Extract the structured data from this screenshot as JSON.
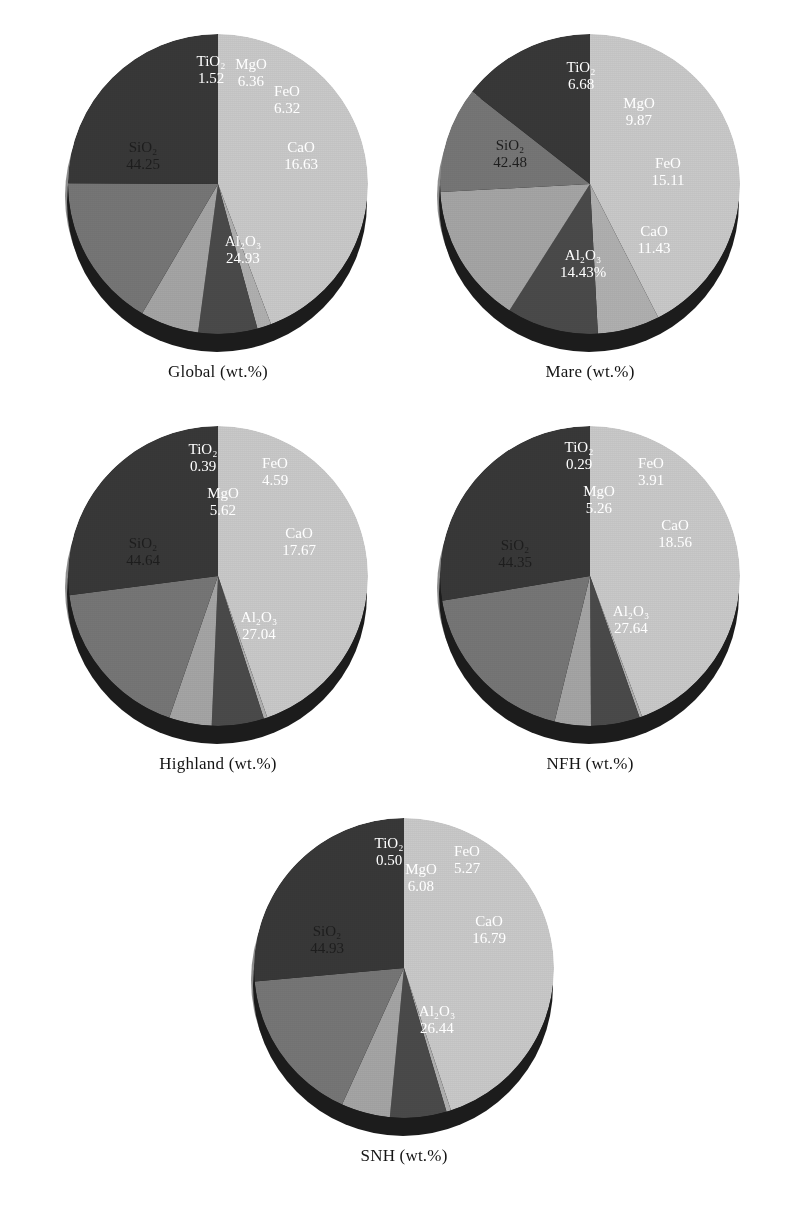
{
  "figure": {
    "background": "#ffffff",
    "label_suffix": "(wt.%)"
  },
  "palette": {
    "SiO2": "#c9c9c9",
    "TiO2": "#b0b0b0",
    "MgO": "#4a4a4a",
    "FeO": "#a5a5a5",
    "CaO": "#767676",
    "Al2O3": "#383838",
    "side_dark": "#1c1c1c",
    "side_light": "#8d8d8d",
    "text_dark": "#1d1d1d",
    "text_light": "#ffffff"
  },
  "chart_data": [
    {
      "type": "pie",
      "title": "Global (wt.%)",
      "region": "Global",
      "units": "wt.%",
      "categories": [
        "SiO2",
        "TiO2",
        "MgO",
        "FeO",
        "CaO",
        "Al2O3"
      ],
      "labels": [
        "SiO₂",
        "TiO₂",
        "MgO",
        "FeO",
        "CaO",
        "Al₂O₃"
      ],
      "values": [
        44.25,
        1.52,
        6.36,
        6.32,
        16.63,
        24.93
      ],
      "value_text": [
        "44.25",
        "1.52",
        "6.36",
        "6.32",
        "16.63",
        "24.93"
      ],
      "label_color": [
        "dark",
        "light",
        "light",
        "light",
        "light",
        "light"
      ]
    },
    {
      "type": "pie",
      "title": "Mare (wt.%)",
      "region": "Mare",
      "units": "wt.%",
      "categories": [
        "SiO2",
        "TiO2",
        "MgO",
        "FeO",
        "CaO",
        "Al2O3"
      ],
      "labels": [
        "SiO₂",
        "TiO₂",
        "MgO",
        "FeO",
        "CaO",
        "Al₂O₃"
      ],
      "values": [
        42.48,
        6.68,
        9.87,
        15.11,
        11.43,
        14.43
      ],
      "value_text": [
        "42.48",
        "6.68",
        "9.87",
        "15.11",
        "11.43",
        "14.43%"
      ],
      "label_color": [
        "dark",
        "light",
        "light",
        "light",
        "light",
        "light"
      ]
    },
    {
      "type": "pie",
      "title": "Highland (wt.%)",
      "region": "Highland",
      "units": "wt.%",
      "categories": [
        "SiO2",
        "TiO2",
        "MgO",
        "FeO",
        "CaO",
        "Al2O3"
      ],
      "labels": [
        "SiO₂",
        "TiO₂",
        "MgO",
        "FeO",
        "CaO",
        "Al₂O₃"
      ],
      "values": [
        44.64,
        0.39,
        5.62,
        4.59,
        17.67,
        27.04
      ],
      "value_text": [
        "44.64",
        "0.39",
        "5.62",
        "4.59",
        "17.67",
        "27.04"
      ],
      "label_color": [
        "dark",
        "light",
        "light",
        "light",
        "light",
        "light"
      ]
    },
    {
      "type": "pie",
      "title": "NFH (wt.%)",
      "region": "NFH",
      "units": "wt.%",
      "categories": [
        "SiO2",
        "TiO2",
        "MgO",
        "FeO",
        "CaO",
        "Al2O3"
      ],
      "labels": [
        "SiO₂",
        "TiO₂",
        "MgO",
        "FeO",
        "CaO",
        "Al₂O₃"
      ],
      "values": [
        44.35,
        0.29,
        5.26,
        3.91,
        18.56,
        27.64
      ],
      "value_text": [
        "44.35",
        "0.29",
        "5.26",
        "3.91",
        "18.56",
        "27.64"
      ],
      "label_color": [
        "dark",
        "light",
        "light",
        "light",
        "light",
        "light"
      ]
    },
    {
      "type": "pie",
      "title": "SNH (wt.%)",
      "region": "SNH",
      "units": "wt.%",
      "categories": [
        "SiO2",
        "TiO2",
        "MgO",
        "FeO",
        "CaO",
        "Al2O3"
      ],
      "labels": [
        "SiO₂",
        "TiO₂",
        "MgO",
        "FeO",
        "CaO",
        "Al₂O₃"
      ],
      "values": [
        44.93,
        0.5,
        6.08,
        5.27,
        16.79,
        26.44
      ],
      "value_text": [
        "44.93",
        "0.50",
        "6.08",
        "5.27",
        "16.79",
        "26.44"
      ],
      "label_color": [
        "dark",
        "light",
        "light",
        "light",
        "light",
        "light"
      ]
    }
  ],
  "layout": {
    "positions": [
      {
        "left": 38,
        "top": 28
      },
      {
        "left": 410,
        "top": 28
      },
      {
        "left": 38,
        "top": 420
      },
      {
        "left": 410,
        "top": 420
      },
      {
        "left": 224,
        "top": 812
      }
    ],
    "label_offsets": [
      [
        {
          "x": 80,
          "y": 128,
          "c": "dark"
        },
        {
          "x": 148,
          "y": 42,
          "c": "light"
        },
        {
          "x": 188,
          "y": 45,
          "c": "light"
        },
        {
          "x": 224,
          "y": 72,
          "c": "light"
        },
        {
          "x": 238,
          "y": 128,
          "c": "light"
        },
        {
          "x": 180,
          "y": 222,
          "c": "light"
        }
      ],
      [
        {
          "x": 75,
          "y": 126,
          "c": "dark"
        },
        {
          "x": 146,
          "y": 48,
          "c": "light"
        },
        {
          "x": 204,
          "y": 84,
          "c": "light"
        },
        {
          "x": 233,
          "y": 144,
          "c": "light"
        },
        {
          "x": 219,
          "y": 212,
          "c": "light"
        },
        {
          "x": 148,
          "y": 236,
          "c": "light"
        }
      ],
      [
        {
          "x": 80,
          "y": 132,
          "c": "dark"
        },
        {
          "x": 140,
          "y": 38,
          "c": "light"
        },
        {
          "x": 160,
          "y": 82,
          "c": "light"
        },
        {
          "x": 212,
          "y": 52,
          "c": "light"
        },
        {
          "x": 236,
          "y": 122,
          "c": "light"
        },
        {
          "x": 196,
          "y": 206,
          "c": "light"
        }
      ],
      [
        {
          "x": 80,
          "y": 134,
          "c": "dark"
        },
        {
          "x": 144,
          "y": 36,
          "c": "light"
        },
        {
          "x": 164,
          "y": 80,
          "c": "light"
        },
        {
          "x": 216,
          "y": 52,
          "c": "light"
        },
        {
          "x": 240,
          "y": 114,
          "c": "light"
        },
        {
          "x": 196,
          "y": 200,
          "c": "light"
        }
      ],
      [
        {
          "x": 78,
          "y": 128,
          "c": "dark"
        },
        {
          "x": 140,
          "y": 40,
          "c": "light"
        },
        {
          "x": 172,
          "y": 66,
          "c": "light"
        },
        {
          "x": 218,
          "y": 48,
          "c": "light"
        },
        {
          "x": 240,
          "y": 118,
          "c": "light"
        },
        {
          "x": 188,
          "y": 208,
          "c": "light"
        }
      ]
    ]
  }
}
